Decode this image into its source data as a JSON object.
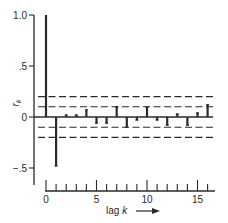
{
  "chart_data": {
    "type": "bar",
    "subtype": "autocorrelation-function",
    "title": "",
    "xlabel": "lag k",
    "ylabel": "r_k",
    "x": [
      0,
      1,
      2,
      3,
      4,
      5,
      6,
      7,
      8,
      9,
      10,
      11,
      12,
      13,
      14,
      15,
      16
    ],
    "values": [
      1.0,
      -0.48,
      0.02,
      0.02,
      0.07,
      -0.06,
      -0.06,
      0.1,
      -0.1,
      -0.03,
      0.1,
      -0.03,
      -0.08,
      0.03,
      -0.08,
      0.04,
      0.12
    ],
    "ylim": [
      -0.67,
      1.0
    ],
    "xlim": [
      0,
      16.7
    ],
    "y_ticks": [
      1.0,
      0.5,
      0,
      -0.5
    ],
    "y_tick_labels": [
      "1.0",
      ".5",
      "0",
      "−.5"
    ],
    "x_ticks": [
      0,
      1,
      2,
      3,
      4,
      5,
      6,
      7,
      8,
      9,
      10,
      11,
      12,
      13,
      14,
      15,
      16
    ],
    "x_tick_labels": {
      "0": "0",
      "5": "5",
      "10": "10",
      "15": "15"
    },
    "reference_lines": [
      {
        "y": 0.2,
        "style": "dashed"
      },
      {
        "y": 0.1,
        "style": "dashed"
      },
      {
        "y": -0.1,
        "style": "dashed"
      },
      {
        "y": -0.2,
        "style": "dashed"
      }
    ],
    "grid": false,
    "legend": null,
    "color": "#2a2a2a"
  },
  "labels": {
    "ylabel_main": "r",
    "ylabel_sub": "k",
    "xlabel_text": "lag",
    "xlabel_var": "k",
    "xlabel_arrow": "→"
  }
}
